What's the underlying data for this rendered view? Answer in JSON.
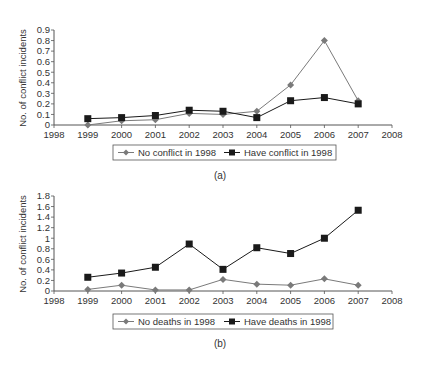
{
  "chart_data": [
    {
      "type": "line",
      "panel_label": "(a)",
      "title": "",
      "xlabel": "",
      "ylabel": "No. of conflict incidents",
      "x_ticks": [
        "1998",
        "1999",
        "2000",
        "2001",
        "2002",
        "2003",
        "2004",
        "2005",
        "2006",
        "2007",
        "2008"
      ],
      "y_ticks": [
        "0",
        "0.1",
        "0.2",
        "0.3",
        "0.4",
        "0.5",
        "0.6",
        "0.7",
        "0.8",
        "0.9"
      ],
      "xlim": [
        1998,
        2008
      ],
      "ylim": [
        0,
        0.9
      ],
      "y_step": 0.1,
      "grid": false,
      "legend_position": "bottom",
      "x": [
        1999,
        2000,
        2001,
        2002,
        2003,
        2004,
        2005,
        2006,
        2007
      ],
      "series": [
        {
          "name": "No conflict in 1998",
          "marker": "diamond",
          "color": "#7a7a7a",
          "values": [
            0.0,
            0.04,
            0.05,
            0.11,
            0.1,
            0.13,
            0.38,
            0.8,
            0.23
          ]
        },
        {
          "name": "Have conflict in 1998",
          "marker": "square",
          "color": "#1a1a1a",
          "values": [
            0.06,
            0.07,
            0.09,
            0.14,
            0.13,
            0.07,
            0.23,
            0.26,
            0.2
          ]
        }
      ]
    },
    {
      "type": "line",
      "panel_label": "(b)",
      "title": "",
      "xlabel": "",
      "ylabel": "No. of conflict incidents",
      "x_ticks": [
        "1998",
        "1999",
        "2000",
        "2001",
        "2002",
        "2003",
        "2004",
        "2005",
        "2006",
        "2007",
        "2008"
      ],
      "y_ticks": [
        "0",
        "0.2",
        "0.4",
        "0.6",
        "0.8",
        "1",
        "1.2",
        "1.4",
        "1.6",
        "1.8"
      ],
      "xlim": [
        1998,
        2008
      ],
      "ylim": [
        0,
        1.8
      ],
      "y_step": 0.2,
      "grid": false,
      "legend_position": "bottom",
      "x": [
        1999,
        2000,
        2001,
        2002,
        2003,
        2004,
        2005,
        2006,
        2007
      ],
      "series": [
        {
          "name": "No deaths in 1998",
          "marker": "diamond",
          "color": "#7a7a7a",
          "values": [
            0.03,
            0.11,
            0.02,
            0.02,
            0.22,
            0.13,
            0.11,
            0.23,
            0.11
          ]
        },
        {
          "name": "Have deaths in 1998",
          "marker": "square",
          "color": "#1a1a1a",
          "values": [
            0.26,
            0.34,
            0.45,
            0.89,
            0.41,
            0.82,
            0.71,
            1.0,
            1.53
          ]
        }
      ]
    }
  ]
}
